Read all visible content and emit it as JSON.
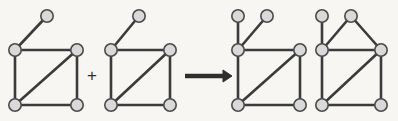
{
  "figure": {
    "background_color": "#f7f6f3",
    "edge_color": "#3b3b3b",
    "node_fill_color": "#d9d9d9",
    "node_stroke_color": "#4a4a4a",
    "operator_color": "#2e2e2e",
    "node_radius": 6.2,
    "width": 398,
    "height": 121
  },
  "operators": [
    {
      "name": "plus",
      "symbol": "+",
      "x": 92,
      "y": 77
    },
    {
      "name": "arrow",
      "symbol": "→",
      "x1": 185,
      "y1": 76,
      "x2": 232,
      "y2": 76
    }
  ],
  "graphs": [
    {
      "id": "operand-1",
      "label": "operand graph 1",
      "node_count": 5,
      "edge_count": 6,
      "nodes": [
        {
          "id": "p1",
          "x": 47,
          "y": 16
        },
        {
          "id": "a",
          "x": 15,
          "y": 50
        },
        {
          "id": "b",
          "x": 77,
          "y": 50
        },
        {
          "id": "c",
          "x": 15,
          "y": 105
        },
        {
          "id": "d",
          "x": 77,
          "y": 105
        }
      ],
      "edges": [
        [
          "a",
          "p1"
        ],
        [
          "a",
          "b"
        ],
        [
          "a",
          "c"
        ],
        [
          "b",
          "d"
        ],
        [
          "b",
          "c"
        ],
        [
          "c",
          "d"
        ]
      ]
    },
    {
      "id": "operand-2",
      "label": "operand graph 2",
      "node_count": 5,
      "edge_count": 6,
      "nodes": [
        {
          "id": "p1",
          "x": 139,
          "y": 16
        },
        {
          "id": "a",
          "x": 111,
          "y": 50
        },
        {
          "id": "b",
          "x": 170,
          "y": 50
        },
        {
          "id": "c",
          "x": 111,
          "y": 105
        },
        {
          "id": "d",
          "x": 170,
          "y": 105
        }
      ],
      "edges": [
        [
          "a",
          "p1"
        ],
        [
          "a",
          "b"
        ],
        [
          "a",
          "c"
        ],
        [
          "b",
          "d"
        ],
        [
          "b",
          "c"
        ],
        [
          "c",
          "d"
        ]
      ]
    },
    {
      "id": "result-1",
      "label": "result graph 1",
      "node_count": 6,
      "edge_count": 7,
      "nodes": [
        {
          "id": "p1",
          "x": 238,
          "y": 16
        },
        {
          "id": "p2",
          "x": 267,
          "y": 16
        },
        {
          "id": "a",
          "x": 238,
          "y": 50
        },
        {
          "id": "b",
          "x": 300,
          "y": 50
        },
        {
          "id": "c",
          "x": 238,
          "y": 105
        },
        {
          "id": "d",
          "x": 300,
          "y": 105
        }
      ],
      "edges": [
        [
          "a",
          "p1"
        ],
        [
          "a",
          "p2"
        ],
        [
          "a",
          "b"
        ],
        [
          "a",
          "c"
        ],
        [
          "b",
          "d"
        ],
        [
          "b",
          "c"
        ],
        [
          "c",
          "d"
        ]
      ]
    },
    {
      "id": "result-2",
      "label": "result graph 2",
      "node_count": 6,
      "edge_count": 8,
      "nodes": [
        {
          "id": "p1",
          "x": 322,
          "y": 16
        },
        {
          "id": "t",
          "x": 351,
          "y": 16
        },
        {
          "id": "a",
          "x": 322,
          "y": 50
        },
        {
          "id": "b",
          "x": 381,
          "y": 50
        },
        {
          "id": "c",
          "x": 322,
          "y": 105
        },
        {
          "id": "d",
          "x": 381,
          "y": 105
        }
      ],
      "edges": [
        [
          "a",
          "p1"
        ],
        [
          "a",
          "t"
        ],
        [
          "t",
          "b"
        ],
        [
          "a",
          "b"
        ],
        [
          "a",
          "c"
        ],
        [
          "b",
          "d"
        ],
        [
          "b",
          "c"
        ],
        [
          "c",
          "d"
        ]
      ]
    }
  ]
}
